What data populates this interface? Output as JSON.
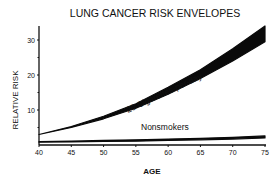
{
  "chart_data": {
    "type": "area",
    "title": "LUNG CANCER RISK ENVELOPES",
    "xlabel": "AGE",
    "ylabel": "RELATIVE RISK",
    "xlim": [
      40,
      75
    ],
    "ylim": [
      0,
      33
    ],
    "x_ticks": [
      40,
      45,
      50,
      55,
      60,
      65,
      70,
      75
    ],
    "y_ticks": [
      10,
      20,
      30
    ],
    "grid": false,
    "legend": null,
    "x": [
      40,
      45,
      50,
      55,
      60,
      65,
      70,
      75
    ],
    "series": [
      {
        "name": "20 Cigarettes-per-day",
        "lower": [
          3,
          5,
          7.5,
          10.5,
          14.5,
          19,
          24,
          29.5
        ],
        "upper": [
          3,
          5.3,
          8.2,
          11.8,
          16.5,
          21.5,
          27.5,
          34
        ]
      },
      {
        "name": "Nonsmokers",
        "lower": [
          0.8,
          0.9,
          1,
          1.1,
          1.3,
          1.5,
          1.7,
          2
        ],
        "upper": [
          1,
          1.1,
          1.3,
          1.5,
          1.7,
          1.9,
          2.2,
          2.6
        ]
      }
    ],
    "annotations": [
      "20 Cigarettes-per-day",
      "Nonsmokers"
    ]
  }
}
